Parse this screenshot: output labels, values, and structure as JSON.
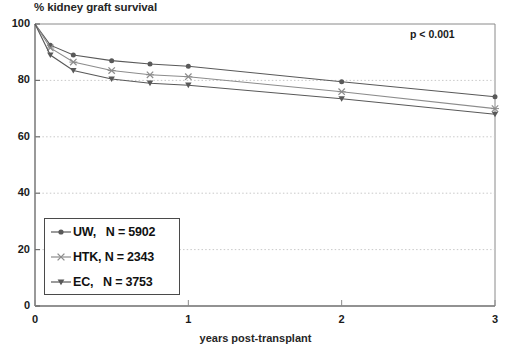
{
  "chart_data": {
    "type": "line",
    "title": "% kidney graft survival",
    "xlabel": "years post-transplant",
    "ylabel": "% kidney graft survival",
    "annotation": "p < 0.001",
    "xlim": [
      0,
      3
    ],
    "ylim": [
      0,
      100
    ],
    "xticks": [
      "0",
      "1",
      "2",
      "3"
    ],
    "xtick_values": [
      0,
      1,
      2,
      3
    ],
    "yticks": [
      "0",
      "20",
      "40",
      "60",
      "80",
      "100"
    ],
    "ytick_values": [
      0,
      20,
      40,
      60,
      80,
      100
    ],
    "grid": "horizontal-dotted",
    "legend_position": "lower-left-inside",
    "series": [
      {
        "name": "UW",
        "n": 5902,
        "legend_label": "UW,   N = 5902",
        "marker": "filled-circle",
        "color": "#595959",
        "x": [
          0,
          0.1,
          0.25,
          0.5,
          0.75,
          1,
          2,
          3
        ],
        "values": [
          100,
          92.5,
          89,
          87,
          85.8,
          85,
          79.5,
          74.2
        ]
      },
      {
        "name": "HTK",
        "n": 2343,
        "legend_label": "HTK, N = 2343",
        "marker": "cross-star",
        "color": "#8c8c8c",
        "x": [
          0,
          0.1,
          0.25,
          0.5,
          0.75,
          1,
          2,
          3
        ],
        "values": [
          100,
          91.5,
          86.5,
          83.5,
          82,
          81.3,
          76,
          70
        ]
      },
      {
        "name": "EC",
        "n": 3753,
        "legend_label": "EC,   N = 3753",
        "marker": "filled-triangle-down",
        "color": "#595959",
        "x": [
          0,
          0.1,
          0.25,
          0.5,
          0.75,
          1,
          2,
          3
        ],
        "values": [
          100,
          89,
          83.5,
          80.5,
          79,
          78.3,
          73.5,
          68
        ]
      }
    ]
  },
  "legend": {
    "items": [
      {
        "label": "UW,   N = 5902",
        "marker": "filled-circle"
      },
      {
        "label": "HTK, N = 2343",
        "marker": "cross-star"
      },
      {
        "label": "EC,   N = 3753",
        "marker": "filled-triangle-down"
      }
    ]
  },
  "axes": {
    "y_labels": [
      "100",
      "80",
      "60",
      "40",
      "20",
      "0"
    ],
    "x_labels": [
      "0",
      "1",
      "2",
      "3"
    ]
  },
  "colors": {
    "axis": "#7a7a7a",
    "grid": "#c9c9c9",
    "series_dark": "#595959",
    "series_light": "#8c8c8c",
    "text": "#1a1a1a"
  }
}
